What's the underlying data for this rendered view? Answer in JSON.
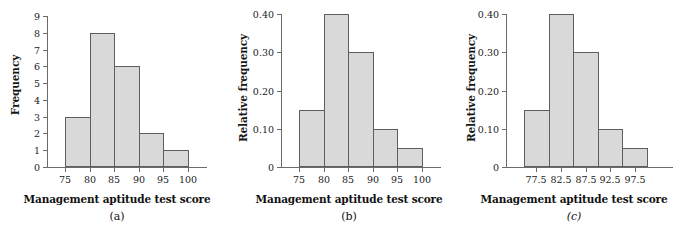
{
  "figure": {
    "background_color": "#ffffff",
    "bar_fill_color": "#d9d9d9",
    "bar_border_color": "#5e5e5e",
    "axis_color": "#6b6b6b",
    "text_color": "#111111"
  },
  "panels": [
    {
      "caption": "(a)",
      "xlabel": "Management aptitude test score",
      "ylabel": "Frequency",
      "ytick_labels": [
        "0",
        "1",
        "2",
        "3",
        "4",
        "5",
        "6",
        "7",
        "8",
        "9"
      ],
      "xtick_labels": [
        "75",
        "80",
        "85",
        "90",
        "95",
        "100"
      ]
    },
    {
      "caption": "(b)",
      "xlabel": "Management aptitude test score",
      "ylabel": "Relative frequency",
      "ytick_labels": [
        "0",
        "0.10",
        "0.20",
        "0.30",
        "0.40"
      ],
      "xtick_labels": [
        "75",
        "80",
        "85",
        "90",
        "95",
        "100"
      ]
    },
    {
      "caption": "(c)",
      "xlabel": "Management aptitude test score",
      "ylabel": "Relative frequency",
      "ytick_labels": [
        "0",
        "0.10",
        "0.20",
        "0.30",
        "0.40"
      ],
      "xtick_labels": [
        "77.5",
        "82.5",
        "87.5",
        "92.5",
        "97.5"
      ]
    }
  ],
  "chart_data": [
    {
      "type": "bar",
      "title": "",
      "subtitle": "",
      "caption": "(a)",
      "xlabel": "Management aptitude test score",
      "ylabel": "Frequency",
      "categories": [
        "75-80",
        "80-85",
        "85-90",
        "90-95",
        "95-100"
      ],
      "bin_edges": [
        75,
        80,
        85,
        90,
        95,
        100
      ],
      "bin_midpoints": [
        77.5,
        82.5,
        87.5,
        92.5,
        97.5
      ],
      "values": [
        3,
        8,
        6,
        2,
        1
      ],
      "xlim": [
        75,
        100
      ],
      "ylim": [
        0,
        9
      ],
      "ytick_values": [
        0,
        1,
        2,
        3,
        4,
        5,
        6,
        7,
        8,
        9
      ],
      "xtick_values": [
        75,
        80,
        85,
        90,
        95,
        100
      ],
      "grid": false,
      "legend": false
    },
    {
      "type": "bar",
      "title": "",
      "subtitle": "",
      "caption": "(b)",
      "xlabel": "Management aptitude test score",
      "ylabel": "Relative frequency",
      "categories": [
        "75-80",
        "80-85",
        "85-90",
        "90-95",
        "95-100"
      ],
      "bin_edges": [
        75,
        80,
        85,
        90,
        95,
        100
      ],
      "bin_midpoints": [
        77.5,
        82.5,
        87.5,
        92.5,
        97.5
      ],
      "values": [
        0.15,
        0.4,
        0.3,
        0.1,
        0.05
      ],
      "xlim": [
        75,
        100
      ],
      "ylim": [
        0,
        0.4
      ],
      "ytick_values": [
        0,
        0.1,
        0.2,
        0.3,
        0.4
      ],
      "xtick_values": [
        75,
        80,
        85,
        90,
        95,
        100
      ],
      "grid": false,
      "legend": false
    },
    {
      "type": "bar",
      "title": "",
      "subtitle": "",
      "caption": "(c)",
      "xlabel": "Management aptitude test score",
      "ylabel": "Relative frequency",
      "categories": [
        "77.5",
        "82.5",
        "87.5",
        "92.5",
        "97.5"
      ],
      "bin_edges": [
        75,
        80,
        85,
        90,
        95,
        100
      ],
      "bin_midpoints": [
        77.5,
        82.5,
        87.5,
        92.5,
        97.5
      ],
      "values": [
        0.15,
        0.4,
        0.3,
        0.1,
        0.05
      ],
      "xlim": [
        75,
        100
      ],
      "ylim": [
        0,
        0.4
      ],
      "ytick_values": [
        0,
        0.1,
        0.2,
        0.3,
        0.4
      ],
      "xtick_values": [
        77.5,
        82.5,
        87.5,
        92.5,
        97.5
      ],
      "grid": false,
      "legend": false
    }
  ]
}
